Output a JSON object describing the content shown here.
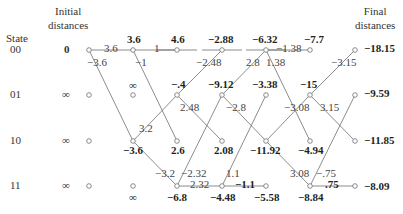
{
  "headers": {
    "state": "State",
    "initial_line1": "Initial",
    "initial_line2": "distances",
    "final_line1": "Final",
    "final_line2": "distances"
  },
  "states": [
    "00",
    "01",
    "10",
    "11"
  ],
  "initial_distances": [
    "0",
    "∞",
    "∞",
    "∞"
  ],
  "columns_x": [
    89,
    133,
    177,
    222,
    266,
    310,
    355
  ],
  "rows_y": [
    50,
    95,
    141,
    186
  ],
  "path_metrics": [
    {
      "col": 1,
      "row": 0,
      "value": "3.6",
      "dx": -6,
      "dy": -17
    },
    {
      "col": 1,
      "row": 1,
      "value": "∞",
      "dx": -4,
      "dy": -16
    },
    {
      "col": 1,
      "row": 2,
      "value": "−3.6",
      "dx": -10,
      "dy": 3
    },
    {
      "col": 1,
      "row": 3,
      "value": "∞",
      "dx": -4,
      "dy": 5
    },
    {
      "col": 2,
      "row": 0,
      "value": "4.6",
      "dx": -6,
      "dy": -17
    },
    {
      "col": 2,
      "row": 1,
      "value": "−.4",
      "dx": -6,
      "dy": -17
    },
    {
      "col": 2,
      "row": 2,
      "value": "2.6",
      "dx": -6,
      "dy": 3
    },
    {
      "col": 2,
      "row": 3,
      "value": "−6.8",
      "dx": -10,
      "dy": 5
    },
    {
      "col": 3,
      "row": 0,
      "value": "−2.88",
      "dx": -14,
      "dy": -17
    },
    {
      "col": 3,
      "row": 1,
      "value": "−9.12",
      "dx": -14,
      "dy": -17
    },
    {
      "col": 3,
      "row": 2,
      "value": "2.08",
      "dx": -8,
      "dy": 3
    },
    {
      "col": 3,
      "row": 3,
      "value": "−4.48",
      "dx": -12,
      "dy": 5
    },
    {
      "col": 4,
      "row": 0,
      "value": "−6.32",
      "dx": -14,
      "dy": -17
    },
    {
      "col": 4,
      "row": 1,
      "value": "−3.38",
      "dx": -14,
      "dy": -17
    },
    {
      "col": 4,
      "row": 2,
      "value": "−11.92",
      "dx": -16,
      "dy": 3
    },
    {
      "col": 4,
      "row": 3,
      "value": "−5.58",
      "dx": -12,
      "dy": 5
    },
    {
      "col": 5,
      "row": 0,
      "value": "−7.7",
      "dx": -6,
      "dy": -17
    },
    {
      "col": 5,
      "row": 1,
      "value": "−15",
      "dx": -10,
      "dy": -17
    },
    {
      "col": 5,
      "row": 2,
      "value": "−4.94",
      "dx": -12,
      "dy": 3
    },
    {
      "col": 5,
      "row": 3,
      "value": "−8.84",
      "dx": -12,
      "dy": 5
    }
  ],
  "final_distances": [
    "−18.15",
    "−9.59",
    "−11.85",
    "−8.09"
  ],
  "branches": [
    {
      "from": [
        0,
        0
      ],
      "to": [
        1,
        0
      ],
      "label": "3.6",
      "lx": 104,
      "ly": 42
    },
    {
      "from": [
        0,
        0
      ],
      "to": [
        1,
        2
      ],
      "label": "−3.6",
      "lx": 87,
      "ly": 56
    },
    {
      "from": [
        1,
        0
      ],
      "to": [
        2,
        0
      ],
      "label": "1",
      "lx": 154,
      "ly": 42
    },
    {
      "from": [
        1,
        0
      ],
      "to": [
        2,
        2
      ],
      "label": "−1",
      "lx": 135,
      "ly": 56
    },
    {
      "from": [
        1,
        2
      ],
      "to": [
        2,
        1
      ],
      "label": "3.2",
      "lx": 139,
      "ly": 122
    },
    {
      "from": [
        1,
        2
      ],
      "to": [
        2,
        3
      ],
      "label": "−3.2",
      "lx": 155,
      "ly": 167
    },
    {
      "from": [
        2,
        1
      ],
      "to": [
        3,
        0
      ],
      "label": "−2.48",
      "lx": 196,
      "ly": 56
    },
    {
      "from": [
        2,
        1
      ],
      "to": [
        3,
        2
      ],
      "label": "2.48",
      "lx": 180,
      "ly": 101
    },
    {
      "from": [
        2,
        3
      ],
      "to": [
        3,
        1
      ],
      "label": "−2.32",
      "lx": 181,
      "ly": 167
    },
    {
      "from": [
        2,
        3
      ],
      "to": [
        3,
        3
      ],
      "label": "2.32",
      "lx": 190,
      "ly": 178
    },
    {
      "from": [
        3,
        1
      ],
      "to": [
        4,
        0
      ],
      "label": "2.8",
      "lx": 246,
      "ly": 56
    },
    {
      "from": [
        3,
        1
      ],
      "to": [
        4,
        2
      ],
      "label": "−2.8",
      "lx": 226,
      "ly": 101
    },
    {
      "from": [
        3,
        3
      ],
      "to": [
        4,
        1
      ],
      "label": "1.1",
      "lx": 226,
      "ly": 167
    },
    {
      "from": [
        3,
        3
      ],
      "to": [
        4,
        3
      ],
      "label": "−1.1",
      "lx": 235,
      "ly": 178,
      "bold": true
    },
    {
      "from": [
        4,
        0
      ],
      "to": [
        5,
        0
      ],
      "label": "−1.38",
      "lx": 276,
      "ly": 42
    },
    {
      "from": [
        4,
        0
      ],
      "to": [
        5,
        2
      ],
      "label": "1.38",
      "lx": 266,
      "ly": 56
    },
    {
      "from": [
        4,
        2
      ],
      "to": [
        5,
        1
      ],
      "label": "−3.08",
      "lx": 284,
      "ly": 101
    },
    {
      "from": [
        4,
        2
      ],
      "to": [
        5,
        3
      ],
      "label": "3.08",
      "lx": 290,
      "ly": 167
    },
    {
      "from": [
        5,
        1
      ],
      "to": [
        6,
        0
      ],
      "label": "−3.15",
      "lx": 331,
      "ly": 56
    },
    {
      "from": [
        5,
        1
      ],
      "to": [
        6,
        2
      ],
      "label": "3.15",
      "lx": 320,
      "ly": 101
    },
    {
      "from": [
        5,
        3
      ],
      "to": [
        6,
        1
      ],
      "label": "−.75",
      "lx": 316,
      "ly": 167
    },
    {
      "from": [
        5,
        3
      ],
      "to": [
        6,
        3
      ],
      "label": ".75",
      "lx": 325,
      "ly": 178,
      "bold": true
    }
  ],
  "stubs": [
    {
      "col": 2,
      "row": 0
    },
    {
      "col": 3,
      "row": 0
    },
    {
      "col": 4,
      "row": 0
    }
  ],
  "colors": {
    "line": "#6d6e71",
    "node_stroke": "#6d6e71",
    "text": "#231f20"
  }
}
